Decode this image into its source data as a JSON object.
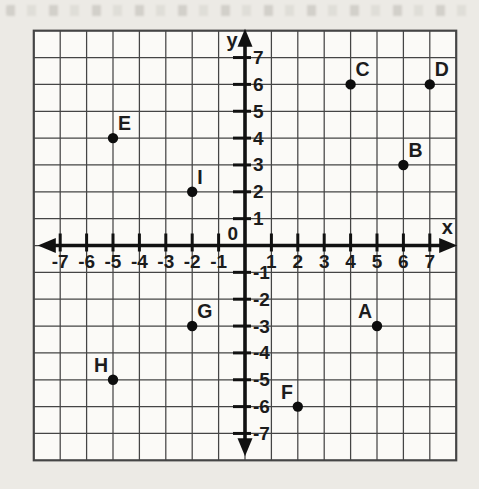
{
  "figure": {
    "page_bg": "#ECEAE5",
    "plot_bg": "#FBFAF7",
    "grid_line_color": "#454545",
    "axis_color": "#111111",
    "point_color": "#0D0D0D",
    "text_color": "#1C1C1C"
  },
  "chart_data": {
    "type": "scatter",
    "title": "",
    "xlabel": "x",
    "ylabel": "y",
    "origin_label": "0",
    "xlim": [
      -8,
      8
    ],
    "ylim": [
      -8,
      8
    ],
    "grid": true,
    "legend": false,
    "x_ticks": [
      -7,
      -6,
      -5,
      -4,
      -3,
      -2,
      -1,
      1,
      2,
      3,
      4,
      5,
      6,
      7
    ],
    "y_ticks": [
      7,
      6,
      5,
      4,
      3,
      2,
      1,
      -1,
      -2,
      -3,
      -4,
      -5,
      -6,
      -7
    ],
    "points": [
      {
        "label": "A",
        "x": 5,
        "y": -3,
        "label_side": "nw"
      },
      {
        "label": "B",
        "x": 6,
        "y": 3,
        "label_side": "ne"
      },
      {
        "label": "C",
        "x": 4,
        "y": 6,
        "label_side": "ne"
      },
      {
        "label": "D",
        "x": 7,
        "y": 6,
        "label_side": "ne"
      },
      {
        "label": "E",
        "x": -5,
        "y": 4,
        "label_side": "ne"
      },
      {
        "label": "F",
        "x": 2,
        "y": -6,
        "label_side": "nw"
      },
      {
        "label": "G",
        "x": -2,
        "y": -3,
        "label_side": "ne"
      },
      {
        "label": "H",
        "x": -5,
        "y": -5,
        "label_side": "nw"
      },
      {
        "label": "I",
        "x": -2,
        "y": 2,
        "label_side": "ne"
      }
    ]
  }
}
